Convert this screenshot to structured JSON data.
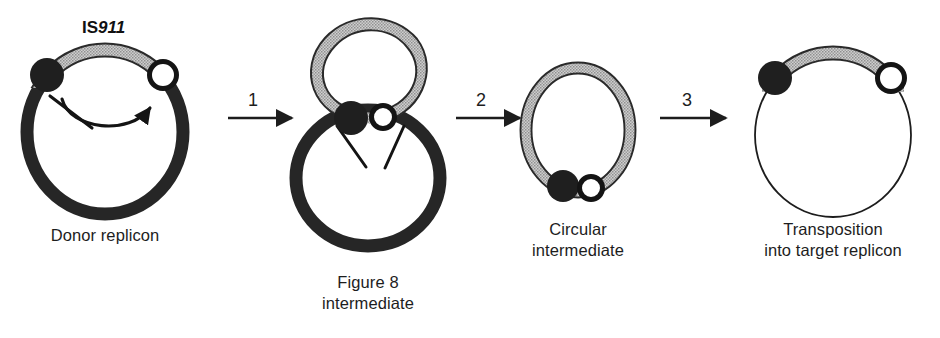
{
  "figure": {
    "title_label": {
      "prefix": "IS",
      "number": "911",
      "full": "IS911"
    },
    "colors": {
      "ink": "#1d1d1d",
      "backbone_black": "#262626",
      "is_band_gray": "#b9b9b9",
      "band_outline": "#2a2a2a",
      "white_circle_fill": "#ffffff",
      "background": "#ffffff"
    },
    "stages": [
      {
        "id": "donor-replicon",
        "caption_lines": [
          "Donor replicon"
        ],
        "backbone": "thick-black-circle",
        "is_element": "gray-stippled-band-top-arc",
        "left_end_marker": "black-filled-circle",
        "right_end_marker": "white-open-circle",
        "annotations": [
          "curved-strand-transfer-arrow",
          "diagonal-nick-tick"
        ]
      },
      {
        "id": "figure-8-intermediate",
        "caption_lines": [
          "Figure 8",
          "intermediate"
        ],
        "backbone": "thick-black-lower-loop",
        "is_element": "gray-stippled-upper-loop",
        "left_end_marker": "black-filled-circle",
        "right_end_marker": "white-open-circle",
        "annotations": [
          "left-nick-tick",
          "right-nick-tick"
        ]
      },
      {
        "id": "circular-intermediate",
        "caption_lines": [
          "Circular",
          "intermediate"
        ],
        "backbone": "none",
        "is_element": "gray-stippled-full-circle",
        "left_end_marker": "black-filled-circle",
        "right_end_marker": "white-open-circle",
        "annotations": []
      },
      {
        "id": "target-replicon",
        "caption_lines": [
          "Transposition",
          "into target replicon"
        ],
        "backbone": "thin-black-circle",
        "is_element": "gray-stippled-band-top-arc",
        "left_end_marker": "black-filled-circle",
        "right_end_marker": "white-open-circle",
        "annotations": []
      }
    ],
    "steps": [
      {
        "number": "1"
      },
      {
        "number": "2"
      },
      {
        "number": "3"
      }
    ]
  }
}
